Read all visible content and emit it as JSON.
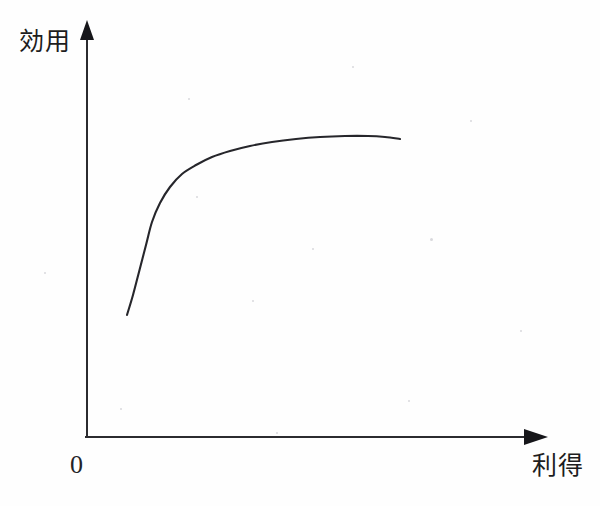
{
  "figure": {
    "background_color": "#fefefe",
    "ink_color": "#26262b",
    "axis_color": "#2b2b2f",
    "y_axis_label": "効用",
    "x_axis_label": "利得",
    "origin_label": "0"
  },
  "chart_data": {
    "type": "line",
    "title": "",
    "subtitle": "",
    "xlabel": "利得",
    "ylabel": "効用",
    "origin_label": "0",
    "grid": false,
    "legend": null,
    "axis_arrows": {
      "x": "arrow-right",
      "y": "arrow-up"
    },
    "axes_pixel_geometry": {
      "origin": [
        85,
        436
      ],
      "x_axis_tip": [
        548,
        437
      ],
      "y_axis_tip": [
        87,
        20
      ]
    },
    "xlim": [
      0,
      1
    ],
    "ylim": [
      0,
      1
    ],
    "series": [
      {
        "name": "utility",
        "shape": "concave-increasing",
        "points_pixel": [
          [
            127,
            315
          ],
          [
            133,
            295
          ],
          [
            139,
            272
          ],
          [
            146,
            245
          ],
          [
            152,
            222
          ],
          [
            160,
            203
          ],
          [
            170,
            187
          ],
          [
            182,
            174
          ],
          [
            196,
            165
          ],
          [
            212,
            157
          ],
          [
            230,
            151
          ],
          [
            250,
            146
          ],
          [
            272,
            142
          ],
          [
            296,
            139
          ],
          [
            320,
            137
          ],
          [
            345,
            136
          ],
          [
            368,
            136
          ],
          [
            385,
            137
          ],
          [
            400,
            139
          ]
        ],
        "x": [
          0.09,
          0.1,
          0.12,
          0.13,
          0.14,
          0.16,
          0.18,
          0.21,
          0.24,
          0.27,
          0.31,
          0.36,
          0.4,
          0.46,
          0.51,
          0.56,
          0.61,
          0.65,
          0.68
        ],
        "values": [
          0.29,
          0.34,
          0.39,
          0.46,
          0.51,
          0.56,
          0.6,
          0.63,
          0.65,
          0.67,
          0.68,
          0.7,
          0.71,
          0.71,
          0.72,
          0.72,
          0.72,
          0.72,
          0.71
        ]
      }
    ]
  }
}
